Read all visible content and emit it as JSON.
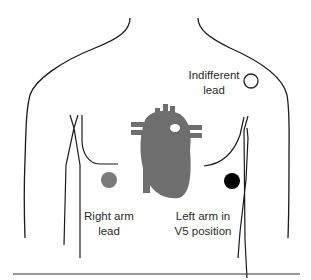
{
  "diagram": {
    "labels": {
      "indifferent_lead": [
        "Indifferent",
        "lead"
      ],
      "right_arm_lead": [
        "Right arm",
        "lead"
      ],
      "left_arm_lead": [
        "Left arm in",
        "V5 position"
      ]
    },
    "electrodes": [
      {
        "name": "indifferent",
        "fill": "#ffffff",
        "stroke": "#222222"
      },
      {
        "name": "right-arm",
        "fill": "#7a7a7a"
      },
      {
        "name": "left-arm-v5",
        "fill": "#000000"
      }
    ],
    "colors": {
      "heart": "#6e6e6e",
      "outline": "#1a1a1a"
    }
  }
}
